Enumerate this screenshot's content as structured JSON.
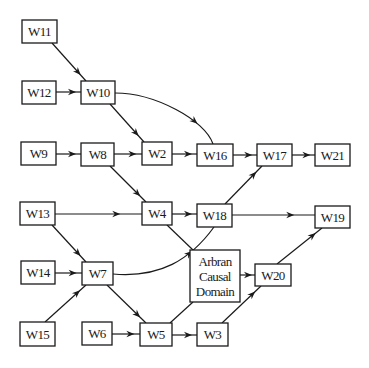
{
  "diagram": {
    "type": "causal-graph",
    "nodes": [
      {
        "id": "W11",
        "label": "W11"
      },
      {
        "id": "W12",
        "label": "W12"
      },
      {
        "id": "W10",
        "label": "W10"
      },
      {
        "id": "W9",
        "label": "W9"
      },
      {
        "id": "W8",
        "label": "W8"
      },
      {
        "id": "W2",
        "label": "W2"
      },
      {
        "id": "W16",
        "label": "W16"
      },
      {
        "id": "W17",
        "label": "W17"
      },
      {
        "id": "W21",
        "label": "W21"
      },
      {
        "id": "W13",
        "label": "W13"
      },
      {
        "id": "W4",
        "label": "W4"
      },
      {
        "id": "W18",
        "label": "W18"
      },
      {
        "id": "W19",
        "label": "W19"
      },
      {
        "id": "W14",
        "label": "W14"
      },
      {
        "id": "W7",
        "label": "W7"
      },
      {
        "id": "ACD",
        "label": "Arbran Causal Domain",
        "lines": [
          "Arbran",
          "Causal",
          "Domain"
        ]
      },
      {
        "id": "W20",
        "label": "W20"
      },
      {
        "id": "W15",
        "label": "W15"
      },
      {
        "id": "W6",
        "label": "W6"
      },
      {
        "id": "W5",
        "label": "W5"
      },
      {
        "id": "W3",
        "label": "W3"
      }
    ],
    "edges": [
      {
        "from": "W11",
        "to": "W10",
        "arrow": true
      },
      {
        "from": "W12",
        "to": "W10",
        "arrow": true
      },
      {
        "from": "W10",
        "to": "W2",
        "arrow": true
      },
      {
        "from": "W10",
        "to": "W16",
        "arrow": true,
        "curved": true
      },
      {
        "from": "W9",
        "to": "W8",
        "arrow": true
      },
      {
        "from": "W8",
        "to": "W2",
        "arrow": true
      },
      {
        "from": "W8",
        "to": "W4",
        "arrow": true
      },
      {
        "from": "W2",
        "to": "W16",
        "arrow": true
      },
      {
        "from": "W16",
        "to": "W17",
        "arrow": true
      },
      {
        "from": "W17",
        "to": "W21",
        "arrow": true
      },
      {
        "from": "W13",
        "to": "W4",
        "arrow": true
      },
      {
        "from": "W13",
        "to": "W7",
        "arrow": true
      },
      {
        "from": "W4",
        "to": "W18",
        "arrow": true
      },
      {
        "from": "W4",
        "to": "ACD",
        "arrow": false
      },
      {
        "from": "W18",
        "to": "W17",
        "arrow": true
      },
      {
        "from": "W18",
        "to": "W19",
        "arrow": true
      },
      {
        "from": "W14",
        "to": "W7",
        "arrow": true
      },
      {
        "from": "W15",
        "to": "W7",
        "arrow": true
      },
      {
        "from": "W7",
        "to": "W18",
        "arrow": true,
        "curved": true
      },
      {
        "from": "W7",
        "to": "W5",
        "arrow": true
      },
      {
        "from": "W6",
        "to": "W5",
        "arrow": true
      },
      {
        "from": "W5",
        "to": "ACD",
        "arrow": false
      },
      {
        "from": "W5",
        "to": "W3",
        "arrow": true
      },
      {
        "from": "ACD",
        "to": "W20",
        "arrow": true
      },
      {
        "from": "W3",
        "to": "W20",
        "arrow": true
      },
      {
        "from": "W20",
        "to": "W19",
        "arrow": true
      }
    ]
  }
}
